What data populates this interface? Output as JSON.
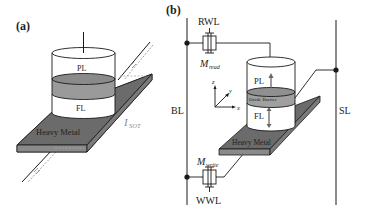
{
  "panels": {
    "a": {
      "label": "(a)",
      "layers": {
        "pinned": "PL",
        "free": "FL",
        "heavy_metal": "Heavy Metal"
      },
      "current_label": "I",
      "current_subscript": "SOT"
    },
    "b": {
      "label": "(b)",
      "lines": {
        "bit_line": "BL",
        "source_line": "SL",
        "read_word_line": "RWL",
        "write_word_line": "WWL"
      },
      "transistors": {
        "read": {
          "symbol": "M",
          "subscript": "read"
        },
        "write": {
          "symbol": "M",
          "subscript": "write"
        }
      },
      "layers": {
        "pinned": "PL",
        "barrier": "Oxide Barrier",
        "free": "FL",
        "heavy_metal": "Heavy Metal"
      },
      "axes": {
        "x": "x",
        "y": "y",
        "z": "z"
      }
    }
  },
  "colors": {
    "heavy_metal": "#6b6b6b",
    "heavy_metal_side": "#8a8a8a",
    "barrier": "#9a9a9a",
    "line": "#1a1a1a",
    "current_label": "#8a8a8a"
  }
}
